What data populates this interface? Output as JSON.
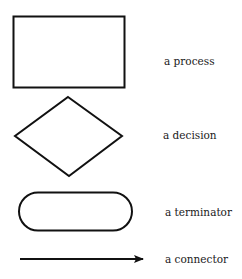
{
  "legend": {
    "items": [
      {
        "shape": "rectangle",
        "label": "a process"
      },
      {
        "shape": "diamond",
        "label": "a decision"
      },
      {
        "shape": "rounded-rectangle",
        "label": "a terminator"
      },
      {
        "shape": "arrow",
        "label": "a connector"
      }
    ]
  },
  "colors": {
    "stroke": "#111111",
    "text": "#1a1a1a",
    "background": "#ffffff"
  }
}
